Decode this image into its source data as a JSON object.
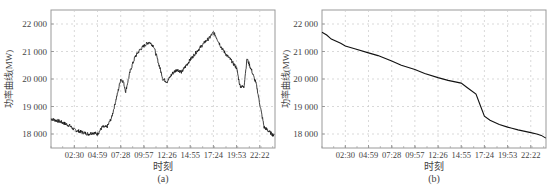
{
  "chart_data": [
    {
      "type": "line",
      "panel_label": "(a)",
      "title": "",
      "xlabel": "时刻",
      "ylabel": "功率曲线(MW)",
      "ylim": [
        17500,
        22500
      ],
      "yticks": [
        18000,
        19000,
        20000,
        21000,
        22000
      ],
      "ytick_labels": [
        "18 000",
        "19 000",
        "20 000",
        "21 000",
        "22 000"
      ],
      "xtick_labels": [
        "02:30",
        "04:59",
        "07:28",
        "09:57",
        "12:26",
        "14:55",
        "17:24",
        "19:53",
        "22:22"
      ],
      "grid": true,
      "x": [
        "00:00",
        "01:00",
        "02:00",
        "02:30",
        "03:00",
        "03:30",
        "04:00",
        "04:30",
        "04:59",
        "05:30",
        "06:00",
        "06:30",
        "07:00",
        "07:15",
        "07:28",
        "07:45",
        "08:00",
        "08:30",
        "09:00",
        "09:30",
        "09:57",
        "10:30",
        "11:00",
        "11:30",
        "12:00",
        "12:26",
        "13:00",
        "13:30",
        "14:00",
        "14:30",
        "14:55",
        "15:30",
        "16:00",
        "16:30",
        "17:00",
        "17:24",
        "17:45",
        "18:15",
        "18:45",
        "19:15",
        "19:53",
        "20:15",
        "20:40",
        "21:00",
        "21:30",
        "22:00",
        "22:22",
        "22:50",
        "23:20",
        "23:50"
      ],
      "series": [
        {
          "name": "功率曲线",
          "values": [
            18550,
            18450,
            18300,
            18150,
            18100,
            18050,
            18000,
            18050,
            18000,
            18250,
            18250,
            18600,
            19300,
            19650,
            20000,
            19900,
            19550,
            20300,
            20800,
            21050,
            21200,
            21350,
            21200,
            20600,
            20000,
            19900,
            20200,
            20350,
            20250,
            20500,
            20700,
            20950,
            21150,
            21350,
            21500,
            21700,
            21500,
            21150,
            20900,
            20700,
            20400,
            19750,
            19700,
            20750,
            20300,
            19800,
            19100,
            18250,
            18100,
            17950
          ]
        }
      ]
    },
    {
      "type": "line",
      "panel_label": "(b)",
      "title": "",
      "xlabel": "时刻",
      "ylabel": "功率曲线(MW)",
      "ylim": [
        17500,
        22500
      ],
      "yticks": [
        18000,
        19000,
        20000,
        21000,
        22000
      ],
      "ytick_labels": [
        "18 000",
        "19 000",
        "20 000",
        "21 000",
        "22 000"
      ],
      "xtick_labels": [
        "02:30",
        "04:59",
        "07:28",
        "09:57",
        "12:26",
        "14:55",
        "17:24",
        "19:53",
        "22:22"
      ],
      "grid": true,
      "x": [
        "00:00",
        "00:30",
        "01:00",
        "02:00",
        "02:30",
        "03:30",
        "04:59",
        "06:00",
        "07:28",
        "08:30",
        "09:57",
        "11:00",
        "12:26",
        "13:30",
        "14:55",
        "15:30",
        "16:30",
        "17:00",
        "17:24",
        "18:00",
        "19:00",
        "19:53",
        "21:00",
        "22:22",
        "23:00",
        "23:30",
        "23:59"
      ],
      "series": [
        {
          "name": "功率曲线(降序排列)",
          "values": [
            21700,
            21600,
            21450,
            21300,
            21200,
            21100,
            20950,
            20850,
            20650,
            20500,
            20350,
            20200,
            20050,
            19950,
            19850,
            19700,
            19450,
            19000,
            18650,
            18500,
            18350,
            18250,
            18150,
            18050,
            18000,
            17950,
            17850
          ]
        }
      ]
    }
  ]
}
